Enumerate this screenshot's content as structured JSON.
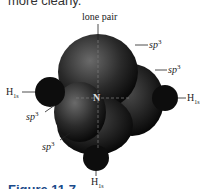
{
  "page": {
    "top_text": "more clearly.",
    "caption": "Figure 11.7"
  },
  "diagram": {
    "center_atom": "N",
    "labels": {
      "lone_pair": "lone pair",
      "sp3_base": "sp",
      "sp3_exp": "3",
      "h_base": "H",
      "h_sub": "1s"
    },
    "colors": {
      "orbital_dark": "#111111",
      "orbital_mid": "#555555",
      "caption": "#1a4a8a"
    }
  }
}
